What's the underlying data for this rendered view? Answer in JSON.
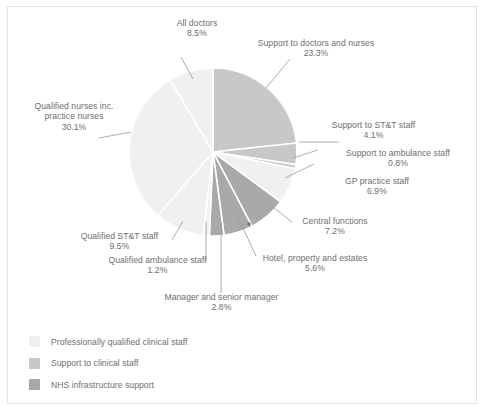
{
  "chart_data": {
    "type": "pie",
    "title": "",
    "subtitle": "",
    "xlabel": "",
    "ylabel": "",
    "legend_position": "bottom-left",
    "grid": false,
    "units": "percent",
    "total": 100.0,
    "start_angle_deg": 0,
    "direction": "clockwise",
    "categories": [
      "Support to doctors and nurses",
      "Support to ST&T staff",
      "Support to ambulance staff",
      "GP practice staff",
      "Central functions",
      "Hotel, property and estates",
      "Manager and senior manager",
      "Qualified ambulance staff",
      "Qualified ST&T staff",
      "Qualified nurses inc. practice nurses",
      "All doctors"
    ],
    "values": [
      23.3,
      4.1,
      0.8,
      6.9,
      7.2,
      5.6,
      2.8,
      1.2,
      9.5,
      30.1,
      8.5
    ],
    "value_labels": [
      "23.3%",
      "4.1%",
      "0.8%",
      "6.9%",
      "7.2%",
      "5.6%",
      "2.8%",
      "1.2%",
      "9.5%",
      "30.1%",
      "8.5%"
    ],
    "group_of_slice": [
      "Support to clinical staff",
      "Support to clinical staff",
      "Support to clinical staff",
      "Professionally qualified clinical staff",
      "NHS infrastructure support",
      "NHS infrastructure support",
      "NHS infrastructure support",
      "Professionally qualified clinical staff",
      "Professionally qualified clinical staff",
      "Professionally qualified clinical staff",
      "Professionally qualified clinical staff"
    ],
    "slice_colors": [
      "#c8c8c8",
      "#c8c8c8",
      "#c8c8c8",
      "#f0f0f0",
      "#a9a9a9",
      "#a9a9a9",
      "#a9a9a9",
      "#f0f0f0",
      "#f0f0f0",
      "#f0f0f0",
      "#f0f0f0"
    ],
    "series": [
      {
        "name": "NHS workforce share",
        "values": [
          23.3,
          4.1,
          0.8,
          6.9,
          7.2,
          5.6,
          2.8,
          1.2,
          9.5,
          30.1,
          8.5
        ]
      }
    ]
  },
  "slices": [
    {
      "name": "All doctors",
      "label": "All doctors",
      "value": "8.5%"
    },
    {
      "name": "Support to doctors and nurses",
      "label": "Support to doctors and nurses",
      "value": "23.3%"
    },
    {
      "name": "Support to ST&T staff",
      "label": "Support to ST&T staff",
      "value": "4.1%"
    },
    {
      "name": "Support to ambulance staff",
      "label": "Support to ambulance staff",
      "value": "0.8%"
    },
    {
      "name": "GP practice staff",
      "label": "GP practice staff",
      "value": "6.9%"
    },
    {
      "name": "Central functions",
      "label": "Central functions",
      "value": "7.2%"
    },
    {
      "name": "Hotel, property and estates",
      "label": "Hotel, property and estates",
      "value": "5.6%"
    },
    {
      "name": "Manager and senior manager",
      "label": "Manager and senior manager",
      "value": "2.8%"
    },
    {
      "name": "Qualified ambulance staff",
      "label": "Qualified ambulance staff",
      "value": "1.2%"
    },
    {
      "name": "Qualified ST&T staff",
      "label": "Qualified ST&T staff",
      "value": "9.5%"
    },
    {
      "name": "Qualified nurses inc. practice nurses",
      "label_line1": "Qualified nurses inc.",
      "label_line2": "practice nurses",
      "value": "30.1%"
    }
  ],
  "legend": {
    "items": [
      {
        "label": "Professionally qualified clinical staff",
        "color": "#f0f0f0"
      },
      {
        "label": "Support to clinical staff",
        "color": "#c8c8c8"
      },
      {
        "label": "NHS infrastructure support",
        "color": "#a9a9a9"
      }
    ]
  },
  "colors": {
    "professionally_qualified": "#f0f0f0",
    "support_to_clinical": "#c8c8c8",
    "nhs_infrastructure": "#a9a9a9",
    "text": "#6e6e6e",
    "leader_line": "#9a9a9a",
    "frame_border": "#e3e3e3",
    "background": "#ffffff"
  }
}
